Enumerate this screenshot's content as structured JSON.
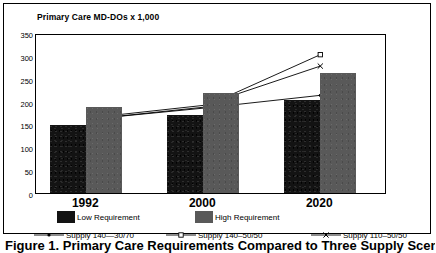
{
  "figure": {
    "caption": "Figure 1. Primary Care Requirements Compared to Three Supply Scenarios"
  },
  "chart_data": {
    "type": "bar",
    "title": "Primary Care MD-DOs x 1,000",
    "xlabel": "",
    "ylabel": "",
    "ylim": [
      0,
      350
    ],
    "yticks": [
      "0",
      "50",
      "100",
      "150",
      "200",
      "250",
      "300",
      "350"
    ],
    "ytick_values": [
      0,
      50,
      100,
      150,
      200,
      250,
      300,
      350
    ],
    "grid": false,
    "legend_position": "bottom",
    "categories": [
      "1992",
      "2000",
      "2020"
    ],
    "series": [
      {
        "name": "Low Requirement",
        "kind": "bar",
        "values": [
          148,
          170,
          203
        ],
        "color": "#131313"
      },
      {
        "name": "High Requirement",
        "kind": "bar",
        "values": [
          188,
          218,
          262
        ],
        "color": "#595959"
      },
      {
        "name": "Supply 140—30/70",
        "kind": "line",
        "marker": "dot",
        "values": [
          165,
          190,
          218
        ],
        "color": "#000000"
      },
      {
        "name": "Supply 140–50/50",
        "kind": "line",
        "marker": "square",
        "values": [
          165,
          192,
          307
        ],
        "color": "#000000"
      },
      {
        "name": "Supply 110–50/50",
        "kind": "line",
        "marker": "x",
        "values": [
          168,
          196,
          282
        ],
        "color": "#000000"
      }
    ]
  },
  "legend": {
    "bars": [
      {
        "label": "Low Requirement"
      },
      {
        "label": "High Requirement"
      }
    ],
    "lines": [
      {
        "label": "Supply 140—30/70",
        "marker": "dot-marker"
      },
      {
        "label": "Supply 140–50/50",
        "marker": "square-marker"
      },
      {
        "label": "Supply 110–50/50",
        "marker": "x-marker"
      }
    ]
  }
}
